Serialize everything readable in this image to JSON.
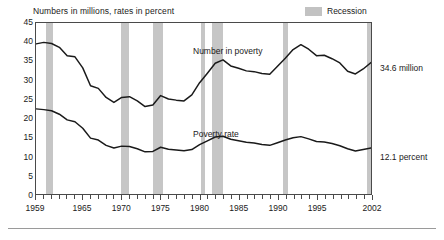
{
  "chart_data": {
    "type": "line",
    "title": "Numbers in millions, rates in percent",
    "xlabel": "",
    "ylabel": "",
    "xlim": [
      1959,
      2002
    ],
    "ylim": [
      0,
      45
    ],
    "ytick_step": 5,
    "grid": false,
    "legend_position": "top-right",
    "legend": [
      {
        "label": "Recession",
        "color": "#c6c6c6",
        "type": "band"
      }
    ],
    "yticks": [
      0,
      5,
      10,
      15,
      20,
      25,
      30,
      35,
      40,
      45
    ],
    "xticks_labeled": [
      1959,
      1965,
      1970,
      1975,
      1980,
      1985,
      1990,
      1995,
      2002
    ],
    "xticks_all_years": true,
    "annotations": [
      {
        "text": "Number in poverty",
        "x": 1981,
        "y": 38.5
      },
      {
        "text": "Poverty rate",
        "x": 1981,
        "y": 17.5
      },
      {
        "text": "34.6 million",
        "x": 2002,
        "y": 34.6,
        "position": "right-outside"
      },
      {
        "text": "12.1 percent",
        "x": 2002,
        "y": 12.1,
        "position": "right-outside"
      }
    ],
    "recessions": [
      {
        "start": 1960.3,
        "end": 1961.2
      },
      {
        "start": 1969.9,
        "end": 1970.9
      },
      {
        "start": 1973.9,
        "end": 1975.2
      },
      {
        "start": 1980.1,
        "end": 1980.6
      },
      {
        "start": 1981.5,
        "end": 1982.9
      },
      {
        "start": 1990.5,
        "end": 1991.2
      },
      {
        "start": 2001.2,
        "end": 2001.9
      }
    ],
    "x": [
      1959,
      1960,
      1961,
      1962,
      1963,
      1964,
      1965,
      1966,
      1967,
      1968,
      1969,
      1970,
      1971,
      1972,
      1973,
      1974,
      1975,
      1976,
      1977,
      1978,
      1979,
      1980,
      1981,
      1982,
      1983,
      1984,
      1985,
      1986,
      1987,
      1988,
      1989,
      1990,
      1991,
      1992,
      1993,
      1994,
      1995,
      1996,
      1997,
      1998,
      1999,
      2000,
      2001,
      2002
    ],
    "series": [
      {
        "name": "Number in poverty",
        "unit": "millions",
        "color": "#1a1a1a",
        "end_value": 34.6,
        "end_label": "34.6 million",
        "values": [
          39.5,
          39.9,
          39.6,
          38.6,
          36.4,
          36.1,
          33.2,
          28.5,
          27.8,
          25.4,
          24.1,
          25.4,
          25.6,
          24.5,
          23.0,
          23.4,
          25.9,
          25.0,
          24.7,
          24.5,
          26.1,
          29.3,
          31.8,
          34.4,
          35.3,
          33.7,
          33.1,
          32.4,
          32.2,
          31.7,
          31.5,
          33.6,
          35.7,
          38.0,
          39.3,
          38.1,
          36.4,
          36.5,
          35.6,
          34.5,
          32.3,
          31.6,
          32.9,
          34.6
        ]
      },
      {
        "name": "Poverty rate",
        "unit": "percent",
        "color": "#1a1a1a",
        "end_value": 12.1,
        "end_label": "12.1 percent",
        "values": [
          22.4,
          22.2,
          21.9,
          21.0,
          19.5,
          19.0,
          17.3,
          14.7,
          14.2,
          12.8,
          12.1,
          12.6,
          12.5,
          11.9,
          11.1,
          11.2,
          12.3,
          11.8,
          11.6,
          11.4,
          11.7,
          13.0,
          14.0,
          15.0,
          15.2,
          14.4,
          14.0,
          13.6,
          13.4,
          13.0,
          12.8,
          13.5,
          14.2,
          14.8,
          15.1,
          14.5,
          13.8,
          13.7,
          13.3,
          12.7,
          11.9,
          11.3,
          11.7,
          12.1
        ]
      }
    ]
  }
}
